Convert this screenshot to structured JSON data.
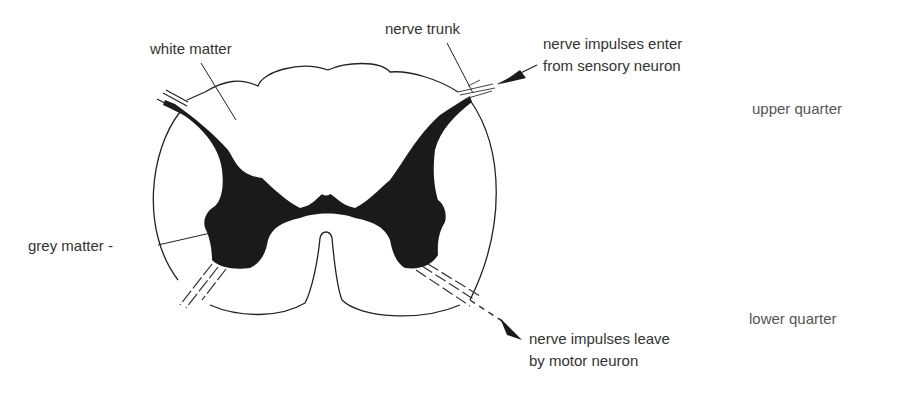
{
  "diagram": {
    "labels": {
      "white_matter": "white matter",
      "nerve_trunk": "nerve trunk",
      "sensory_line1": "nerve impulses enter",
      "sensory_line2": "from sensory neuron",
      "grey_matter": "grey matter -",
      "motor_line1": "nerve impulses leave",
      "motor_line2": "by motor neuron",
      "upper_quarter": "upper quarter",
      "lower_quarter": "lower quarter"
    },
    "colors": {
      "ink": "#1a1a1a",
      "text": "#333333",
      "background": "#ffffff"
    }
  }
}
